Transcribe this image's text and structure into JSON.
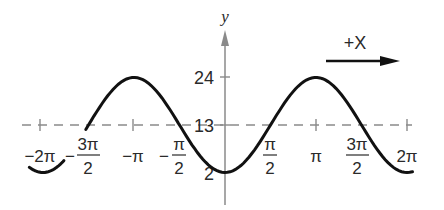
{
  "diagram": {
    "type": "sinusoid",
    "function": "y = 13 - 11cos(x)",
    "y_axis_label": "y",
    "direction_label": "+X",
    "y_ticks": [
      {
        "label": "24",
        "value": 24
      },
      {
        "label": "13",
        "value": 13
      },
      {
        "label": "2",
        "value": 2
      }
    ],
    "x_ticks": {
      "neg_2pi": "−2π",
      "neg_3pi_2_sign": "−",
      "neg_3pi_2_num": "3π",
      "neg_3pi_2_den": "2",
      "neg_pi": "−π",
      "neg_pi_2_sign": "−",
      "neg_pi_2_num": "π",
      "neg_pi_2_den": "2",
      "pi_2_num": "π",
      "pi_2_den": "2",
      "pi": "π",
      "three_pi_2_num": "3π",
      "three_pi_2_den": "2",
      "two_pi": "2π"
    },
    "midline_value": 13,
    "colors": {
      "curve": "#111111",
      "axis": "#8a8a8a",
      "midline": "#8a8a8a",
      "text": "#2a2a2a"
    }
  }
}
